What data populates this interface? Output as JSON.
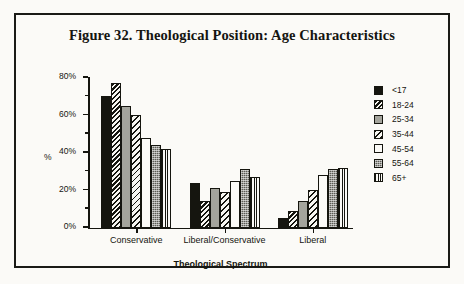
{
  "figure": {
    "title": "Figure 32. Theological Position: Age Characteristics",
    "frame_color": "#1a1a16",
    "background_color": "#fbfaf7"
  },
  "legend": {
    "position": "right",
    "items": [
      {
        "label": "<17",
        "pattern": "solid-black",
        "swatch_name": "legend-swatch-under17"
      },
      {
        "label": "18-24",
        "pattern": "diagonal-dark",
        "swatch_name": "legend-swatch-18-24"
      },
      {
        "label": "25-34",
        "pattern": "gray-mid",
        "swatch_name": "legend-swatch-25-34"
      },
      {
        "label": "35-44",
        "pattern": "diagonal-light",
        "swatch_name": "legend-swatch-35-44"
      },
      {
        "label": "45-54",
        "pattern": "white",
        "swatch_name": "legend-swatch-45-54"
      },
      {
        "label": "55-64",
        "pattern": "stipple-dark",
        "swatch_name": "legend-swatch-55-64"
      },
      {
        "label": "65+",
        "pattern": "vertical-line",
        "swatch_name": "legend-swatch-65plus"
      }
    ]
  },
  "axes": {
    "y_title": "%",
    "x_title": "Theological  Spectrum",
    "y_ticks": [
      "0%",
      "20%",
      "40%",
      "60%",
      "80%"
    ],
    "y_tick_values": [
      0,
      20,
      40,
      60,
      80
    ],
    "y_minor_values": [
      10,
      30,
      50,
      70
    ]
  },
  "chart_data": {
    "type": "bar",
    "title": "Figure 32. Theological Position: Age Characteristics",
    "xlabel": "Theological  Spectrum",
    "ylabel": "%",
    "ylim": [
      0,
      80
    ],
    "grid": false,
    "legend_position": "right",
    "categories": [
      "Conservative",
      "Liberal/Conservative",
      "Liberal"
    ],
    "series": [
      {
        "name": "<17",
        "values": [
          70,
          24,
          5
        ]
      },
      {
        "name": "18-24",
        "values": [
          77,
          14,
          9
        ]
      },
      {
        "name": "25-34",
        "values": [
          65,
          21,
          14
        ]
      },
      {
        "name": "35-44",
        "values": [
          60,
          19,
          20
        ]
      },
      {
        "name": "45-54",
        "values": [
          48,
          25,
          28
        ]
      },
      {
        "name": "55-64",
        "values": [
          44,
          31,
          31
        ]
      },
      {
        "name": "65+",
        "values": [
          42,
          27,
          32
        ]
      }
    ]
  }
}
